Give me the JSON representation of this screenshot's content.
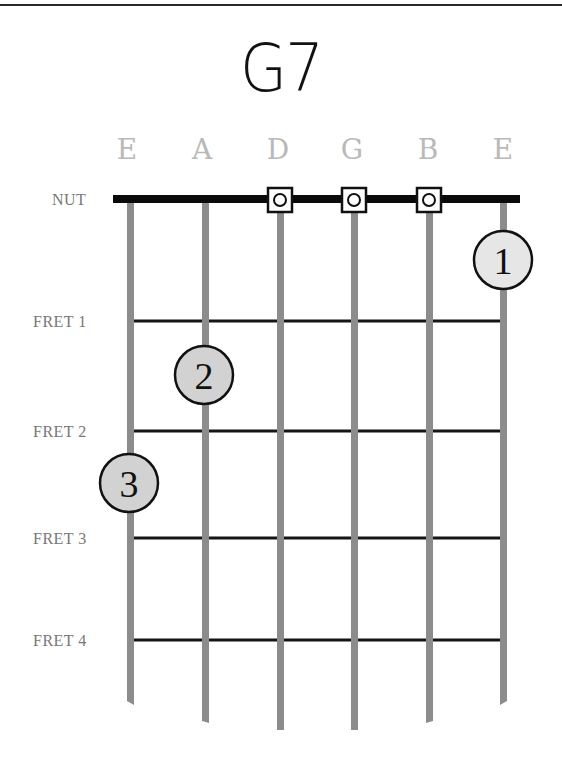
{
  "chord": {
    "name": "G7"
  },
  "strings": [
    {
      "label": "E",
      "x": 130,
      "bottom": 703
    },
    {
      "label": "A",
      "x": 205,
      "bottom": 722
    },
    {
      "label": "D",
      "x": 280,
      "bottom": 730
    },
    {
      "label": "G",
      "x": 354,
      "bottom": 730
    },
    {
      "label": "B",
      "x": 429,
      "bottom": 722
    },
    {
      "label": "E",
      "x": 503,
      "bottom": 703
    }
  ],
  "rows": {
    "nut": {
      "label": "NUT",
      "y": 199
    },
    "frets": [
      {
        "label": "FRET 1",
        "y": 321
      },
      {
        "label": "FRET 2",
        "y": 431
      },
      {
        "label": "FRET 3",
        "y": 538
      },
      {
        "label": "FRET 4",
        "y": 640
      }
    ]
  },
  "open_strings": [
    {
      "string": "D",
      "x": 280
    },
    {
      "string": "G",
      "x": 354
    },
    {
      "string": "B",
      "x": 429
    }
  ],
  "fingers": [
    {
      "number": "1",
      "string": "E (high)",
      "x": 503,
      "y": 260,
      "fill": "#e6e6e6"
    },
    {
      "number": "2",
      "string": "A",
      "x": 204,
      "y": 375,
      "fill": "#d2d2d2"
    },
    {
      "number": "3",
      "string": "E (low)",
      "x": 129,
      "y": 483,
      "fill": "#d2d2d2"
    }
  ],
  "colors": {
    "string": "#8c8c8c",
    "fret": "#151515",
    "nut": "#0a0a0a",
    "label": "#777777",
    "string_label": "#b9b9b9"
  }
}
